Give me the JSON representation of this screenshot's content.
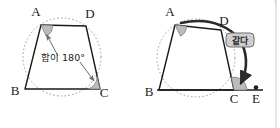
{
  "figure": {
    "background_color": "#ffffff",
    "stroke_color": "#1a1a1a",
    "circle_color": "#8c8c8c",
    "angle_fill": "#b9b9b9",
    "badge_fill": "#cfcfcf",
    "badge_stroke": "#6e6e6e",
    "panel_border_color": "#d8d8d8",
    "left": {
      "name": "cyclic-quadrilateral-opposite-angles",
      "vertices": [
        {
          "label": "A",
          "x": 41,
          "y": 25,
          "lx": 36,
          "ly": 16
        },
        {
          "label": "D",
          "x": 86,
          "y": 26,
          "lx": 88,
          "ly": 18
        },
        {
          "label": "B",
          "x": 25,
          "y": 89,
          "lx": 14,
          "ly": 95
        },
        {
          "label": "C",
          "x": 100,
          "y": 89,
          "lx": 102,
          "ly": 96
        }
      ],
      "annotation": "합이 180°",
      "annotation_x": 63,
      "annotation_y": 61,
      "circle": {
        "cx": 62,
        "cy": 57,
        "r": 39
      },
      "angle_markers": [
        {
          "at": "A",
          "x": 41,
          "y": 25
        },
        {
          "at": "C",
          "x": 100,
          "y": 89
        }
      ],
      "arrows": [
        {
          "from_x": 58,
          "from_y": 56,
          "to_x": 45,
          "to_y": 33
        },
        {
          "from_x": 80,
          "from_y": 62,
          "to_x": 95,
          "to_y": 82
        }
      ]
    },
    "right": {
      "name": "exterior-angle-equals-opposite-interior-angle",
      "vertices": [
        {
          "label": "A",
          "x": 175,
          "y": 25,
          "lx": 170,
          "ly": 16
        },
        {
          "label": "D",
          "x": 221,
          "y": 30,
          "lx": 222,
          "ly": 24
        },
        {
          "label": "B",
          "x": 159,
          "y": 90,
          "lx": 148,
          "ly": 96
        },
        {
          "label": "C",
          "x": 234,
          "y": 90,
          "lx": 233,
          "ly": 100
        },
        {
          "label": "E",
          "x": 256,
          "y": 90,
          "lx": 253,
          "ly": 102
        }
      ],
      "badge_label": "같다",
      "badge_x": 239,
      "badge_y": 32,
      "circle": {
        "cx": 196,
        "cy": 58,
        "r": 39
      },
      "angle_markers": [
        {
          "at": "A",
          "x": 175,
          "y": 25
        },
        {
          "at": "C-exterior",
          "x": 234,
          "y": 90
        }
      ],
      "extension_line": {
        "x1": 159,
        "y1": 90,
        "x2": 262,
        "y2": 90
      },
      "point_marker": {
        "x": 256,
        "y": 88
      }
    }
  }
}
